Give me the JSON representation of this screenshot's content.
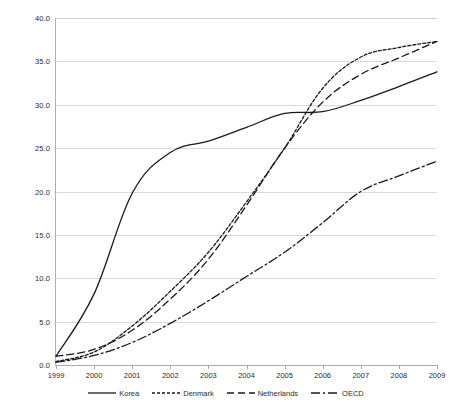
{
  "chart_data": {
    "type": "line",
    "title": "",
    "subtitle": "",
    "xlabel": "",
    "ylabel": "",
    "x": [
      1999,
      2000,
      2001,
      2002,
      2003,
      2004,
      2005,
      2006,
      2007,
      2008,
      2009
    ],
    "xtick_labels": [
      "1999",
      "2000",
      "2001",
      "2002",
      "2003",
      "2004",
      "2005",
      "2006",
      "2007",
      "2008",
      "2009"
    ],
    "ytick_labels": [
      "0.0",
      "5.0",
      "10.0",
      "15.0",
      "20.0",
      "25.0",
      "30.0",
      "35.0",
      "40.0"
    ],
    "ytick_values": [
      0.0,
      5.0,
      10.0,
      15.0,
      20.0,
      25.0,
      30.0,
      35.0,
      40.0
    ],
    "xlim": [
      1999,
      2009
    ],
    "ylim": [
      0.0,
      40.0
    ],
    "grid": "horizontal",
    "legend_position": "bottom",
    "series": [
      {
        "name": "Korea",
        "style": "solid",
        "color": "#1a1a1a",
        "values": [
          1.0,
          8.2,
          19.8,
          24.5,
          25.8,
          27.4,
          29.0,
          29.2,
          30.5,
          32.1,
          33.8
        ]
      },
      {
        "name": "Denmark",
        "style": "dotted",
        "color": "#1a1a1a",
        "values": [
          0.4,
          1.5,
          4.5,
          8.5,
          13.0,
          18.8,
          25.0,
          31.9,
          35.5,
          36.6,
          37.3
        ]
      },
      {
        "name": "Netherlands",
        "style": "dashed",
        "color": "#1a1a1a",
        "values": [
          1.0,
          1.8,
          4.0,
          7.6,
          12.2,
          18.4,
          25.0,
          30.3,
          33.5,
          35.4,
          37.3
        ]
      },
      {
        "name": "OECD",
        "style": "dash-dot",
        "color": "#1a1a1a",
        "values": [
          0.3,
          1.1,
          2.6,
          4.8,
          7.4,
          10.2,
          13.0,
          16.4,
          20.0,
          21.8,
          23.5
        ]
      }
    ]
  }
}
